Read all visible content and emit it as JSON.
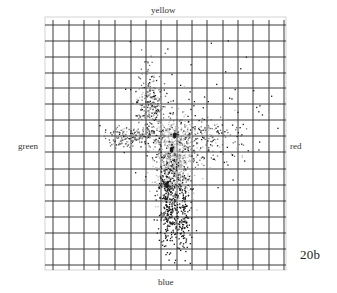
{
  "labels": {
    "top": "yellow",
    "left": "green",
    "right": "red",
    "bottom": "blue",
    "figure_id": "20b"
  },
  "colors": {
    "background": "#ffffff",
    "grid": "#3a3a3a",
    "frame": "#c8c8c8",
    "point_dark": "#1a1a1a",
    "point_mid": "#6e6e6e",
    "point_light": "#bdbdbd"
  },
  "chart_data": {
    "type": "scatter",
    "title": "",
    "subtitle": "20b",
    "xlabel": "green (left) ↔ red (right)",
    "ylabel": "blue (bottom) ↔ yellow (top)",
    "axis_end_labels": {
      "top": "yellow",
      "bottom": "blue",
      "left": "green",
      "right": "red"
    },
    "grid": true,
    "grid_cells": {
      "columns": 15,
      "rows": 15
    },
    "xlim": [
      -7.5,
      7.5
    ],
    "ylim": [
      -7.5,
      7.5
    ],
    "legend": null,
    "series": [
      {
        "name": "core",
        "shade": "light",
        "center": [
          0.3,
          -0.8
        ],
        "spread": [
          0.6,
          1.4
        ],
        "count": 700
      },
      {
        "name": "upper-left arm",
        "shade": "mid",
        "center": [
          -1.2,
          2.6
        ],
        "spread": [
          0.45,
          1.2
        ],
        "count": 260
      },
      {
        "name": "left arm",
        "shade": "mid",
        "center": [
          -2.4,
          0.5
        ],
        "spread": [
          1.0,
          0.35
        ],
        "count": 200
      },
      {
        "name": "right arm",
        "shade": "mid",
        "center": [
          2.2,
          0.3
        ],
        "spread": [
          1.3,
          0.8
        ],
        "count": 220
      },
      {
        "name": "lower tail",
        "shade": "dark",
        "center": [
          0.0,
          -3.6
        ],
        "spread": [
          0.35,
          1.6
        ],
        "count": 320
      },
      {
        "name": "lower-right tail",
        "shade": "dark",
        "center": [
          0.95,
          -4.3
        ],
        "spread": [
          0.25,
          1.5
        ],
        "count": 150
      },
      {
        "name": "sparse outliers",
        "shade": "dark",
        "center": [
          2.0,
          1.5
        ],
        "spread": [
          2.2,
          2.2
        ],
        "count": 90
      }
    ],
    "highlights": [
      {
        "x": 0.4,
        "y": 0.6,
        "note": "dark blob"
      },
      {
        "x": 0.2,
        "y": -0.3,
        "note": "dark blob"
      },
      {
        "x": -0.1,
        "y": -2.5,
        "note": "dense dark column"
      }
    ]
  },
  "layout": {
    "plot_left": 45,
    "plot_top": 17,
    "plot_right": 286,
    "plot_bottom": 270,
    "v_lines": [
      53,
      69,
      84,
      99,
      115,
      131,
      146,
      161,
      177,
      192,
      207,
      223,
      238,
      253,
      269,
      284
    ],
    "h_lines": [
      25,
      41,
      57,
      73,
      88,
      104,
      120,
      136,
      152,
      169,
      185,
      201,
      217,
      233,
      249,
      265
    ],
    "origin_px": [
      168.5,
      145
    ],
    "unit_px": [
      15.4,
      16
    ]
  }
}
